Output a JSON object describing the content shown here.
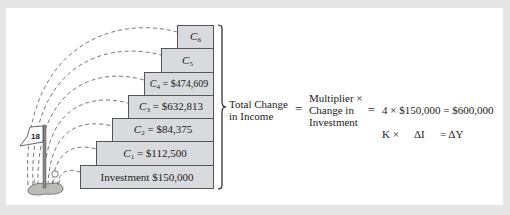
{
  "diagram": {
    "steps": [
      {
        "id": "investment",
        "label": "Investment $150,000"
      },
      {
        "id": "c1",
        "name": "C",
        "sub": "1",
        "value": " = $112,500"
      },
      {
        "id": "c2",
        "name": "C",
        "sub": "2",
        "value": " = $84,375"
      },
      {
        "id": "c3",
        "name": "C",
        "sub": "3",
        "value": " = $632,813"
      },
      {
        "id": "c4",
        "name": "C",
        "sub": "4",
        "value": " = $474,609"
      },
      {
        "id": "c5",
        "name": "C",
        "sub": "5",
        "value": ""
      },
      {
        "id": "c6",
        "name": "C",
        "sub": "6",
        "value": ""
      }
    ],
    "flag_number": "18",
    "equation": {
      "lhs_line1": "Total Change",
      "lhs_line2": "in Income",
      "eq1": "=",
      "mid_line1": "Multiplier ×",
      "mid_line2": "Change in",
      "mid_line3": "Investment",
      "eq2": "=",
      "result": "4 × $150,000 = $600,000",
      "sym_k": "K ×",
      "sym_di": "ΔI",
      "sym_eq": "= ΔY"
    }
  }
}
